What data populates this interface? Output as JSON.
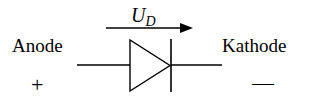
{
  "diagram": {
    "type": "diode-symbol",
    "voltage_label": {
      "symbol": "U",
      "subscript": "D"
    },
    "left_terminal": {
      "label": "Anode",
      "polarity": "+"
    },
    "right_terminal": {
      "label": "Kathode",
      "polarity": "—"
    },
    "arrow_direction": "left-to-right",
    "colors": {
      "stroke": "#000000",
      "background": "#ffffff"
    }
  }
}
